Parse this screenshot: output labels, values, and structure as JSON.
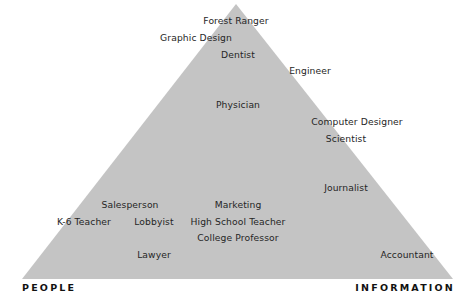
{
  "diagram": {
    "shape": "triangle",
    "fill_color": "#c4c4c4",
    "text_color": "#262626",
    "axes": {
      "left_label": "PEOPLE",
      "right_label": "INFORMATION"
    },
    "labels": [
      {
        "text": "Forest Ranger",
        "x": 236,
        "y": 20
      },
      {
        "text": "Graphic Design",
        "x": 196,
        "y": 37
      },
      {
        "text": "Dentist",
        "x": 238,
        "y": 54
      },
      {
        "text": "Engineer",
        "x": 310,
        "y": 70
      },
      {
        "text": "Physician",
        "x": 238,
        "y": 104
      },
      {
        "text": "Computer Designer",
        "x": 357,
        "y": 121
      },
      {
        "text": "Scientist",
        "x": 346,
        "y": 138
      },
      {
        "text": "Journalist",
        "x": 346,
        "y": 187
      },
      {
        "text": "Salesperson",
        "x": 130,
        "y": 204
      },
      {
        "text": "Marketing",
        "x": 238,
        "y": 204
      },
      {
        "text": "K-6 Teacher",
        "x": 84,
        "y": 221
      },
      {
        "text": "Lobbyist",
        "x": 154,
        "y": 221
      },
      {
        "text": "High School Teacher",
        "x": 238,
        "y": 221
      },
      {
        "text": "College Professor",
        "x": 238,
        "y": 237
      },
      {
        "text": "Lawyer",
        "x": 154,
        "y": 254
      },
      {
        "text": "Accountant",
        "x": 407,
        "y": 254
      }
    ]
  }
}
